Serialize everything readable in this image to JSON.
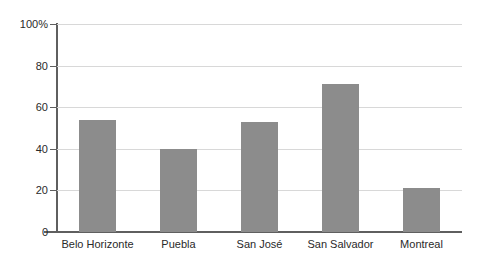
{
  "chart_data": {
    "type": "bar",
    "title": "",
    "xlabel": "",
    "ylabel": "",
    "categories": [
      "Belo Horizonte",
      "Puebla",
      "San José",
      "San Salvador",
      "Montreal"
    ],
    "values": [
      54,
      40,
      53,
      71,
      21
    ],
    "ylim": [
      0,
      100
    ],
    "ytick_labels": [
      "100%",
      "80",
      "60",
      "40",
      "20",
      "0"
    ],
    "ytick_values": [
      100,
      80,
      60,
      40,
      20,
      0
    ],
    "grid": true,
    "grid_axis": "y",
    "legend": "none",
    "bar_color": "#8c8c8c",
    "axis_color": "#5f5f5f",
    "gridline_color": "#d8d8d8",
    "background_color": "#ffffff"
  }
}
